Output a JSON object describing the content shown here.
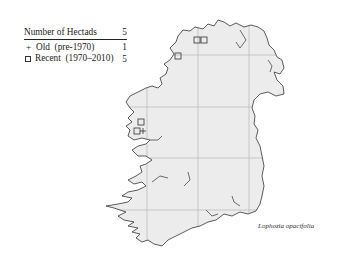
{
  "legend": {
    "header_label": "Number of Hectads",
    "header_value": "5",
    "items": [
      {
        "symbol": "plus-icon",
        "label": "Old  (pre-1970)",
        "value": "1"
      },
      {
        "symbol": "square-icon",
        "label": "Recent  (1970–2010)",
        "value": "5"
      }
    ]
  },
  "species_name": "Lophozia opacifolia",
  "map": {
    "region": "Ireland",
    "land_color": "#ececec",
    "coast_color": "#333333",
    "grid_color": "#b8b8b8",
    "grid_x": [
      147,
      198,
      249
    ],
    "grid_y": [
      55,
      107,
      158,
      210
    ],
    "records": [
      {
        "type": "recent",
        "x": 197,
        "y": 40
      },
      {
        "type": "recent",
        "x": 204,
        "y": 40
      },
      {
        "type": "recent",
        "x": 178,
        "y": 56
      },
      {
        "type": "recent",
        "x": 141,
        "y": 122
      },
      {
        "type": "recent",
        "x": 137,
        "y": 131
      },
      {
        "type": "old",
        "x": 140,
        "y": 131
      }
    ]
  }
}
